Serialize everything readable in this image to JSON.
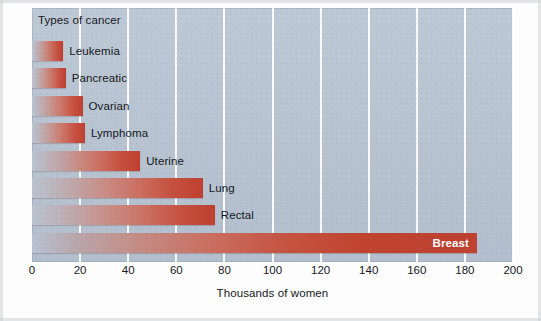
{
  "chart_data": {
    "type": "bar",
    "orientation": "horizontal",
    "title": "Types of cancer",
    "xlabel": "Thousands of women",
    "ylabel": "Types of cancer",
    "xlim": [
      0,
      200
    ],
    "xticks": [
      0,
      20,
      40,
      60,
      80,
      100,
      120,
      140,
      160,
      180,
      200
    ],
    "grid": "vertical-white",
    "legend": "none",
    "categories": [
      "Leukemia",
      "Pancreatic",
      "Ovarian",
      "Lymphoma",
      "Uterine",
      "Lung",
      "Rectal",
      "Breast"
    ],
    "values": [
      13,
      14,
      21,
      22,
      45,
      71,
      76,
      185
    ],
    "bars": [
      {
        "label": "Leukemia",
        "value": 13,
        "label_position": "outside"
      },
      {
        "label": "Pancreatic",
        "value": 14,
        "label_position": "outside"
      },
      {
        "label": "Ovarian",
        "value": 21,
        "label_position": "outside"
      },
      {
        "label": "Lymphoma",
        "value": 22,
        "label_position": "outside"
      },
      {
        "label": "Uterine",
        "value": 45,
        "label_position": "outside"
      },
      {
        "label": "Lung",
        "value": 71,
        "label_position": "outside"
      },
      {
        "label": "Rectal",
        "value": 76,
        "label_position": "outside"
      },
      {
        "label": "Breast",
        "value": 185,
        "label_position": "inside"
      }
    ],
    "colors": {
      "plot_background": "#b6c2d1",
      "gridline": "#ffffff",
      "bar_start": "#b9c4d1",
      "bar_end": "#bf3f30",
      "text": "#15181c",
      "inside_label_text": "#ffffff",
      "page_background": "#fdfdfd"
    }
  }
}
